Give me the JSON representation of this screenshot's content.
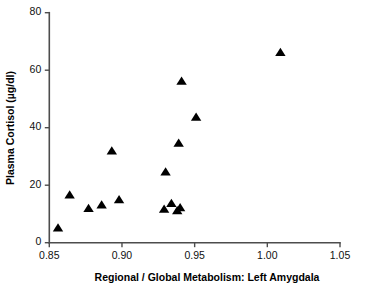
{
  "chart_data": {
    "type": "scatter",
    "title": "",
    "xlabel": "Regional / Global Metabolism: Left Amygdala",
    "ylabel": "Plasma Cortisol (µg/dl)",
    "xlim": [
      0.85,
      1.05
    ],
    "ylim": [
      0,
      80
    ],
    "xticks": [
      0.85,
      0.9,
      0.95,
      1.0,
      1.05
    ],
    "xticklabels": [
      "0.85",
      "0.90",
      "0.95",
      "1.00",
      "1.05"
    ],
    "yticks": [
      0,
      20,
      40,
      60,
      80
    ],
    "yticklabels": [
      "0",
      "20",
      "40",
      "60",
      "80"
    ],
    "grid": false,
    "legend": null,
    "marker": "triangle",
    "marker_color": "#000000",
    "series": [
      {
        "name": "Subjects",
        "points": [
          {
            "x": 0.856,
            "y": 5.0
          },
          {
            "x": 0.864,
            "y": 16.5
          },
          {
            "x": 0.877,
            "y": 11.8
          },
          {
            "x": 0.886,
            "y": 13.0
          },
          {
            "x": 0.893,
            "y": 31.8
          },
          {
            "x": 0.898,
            "y": 14.8
          },
          {
            "x": 0.929,
            "y": 11.5
          },
          {
            "x": 0.93,
            "y": 24.5
          },
          {
            "x": 0.934,
            "y": 13.5
          },
          {
            "x": 0.938,
            "y": 11.0
          },
          {
            "x": 0.94,
            "y": 12.0
          },
          {
            "x": 0.939,
            "y": 34.5
          },
          {
            "x": 0.941,
            "y": 56.0
          },
          {
            "x": 0.951,
            "y": 43.5
          },
          {
            "x": 1.009,
            "y": 66.0
          }
        ]
      }
    ]
  },
  "axes": {
    "x_title": "Regional / Global Metabolism: Left Amygdala",
    "y_title": "Plasma Cortisol (µg/dl)",
    "axis_color": "#4d4d4d"
  }
}
